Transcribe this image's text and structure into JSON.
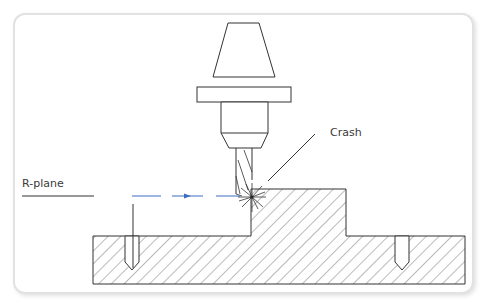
{
  "diagram": {
    "labels": {
      "r_plane": "R-plane",
      "crash": "Crash"
    },
    "colors": {
      "line": "#333333",
      "hatch": "#555555",
      "toolpath": "#3b6fc4",
      "frame_border": "#e2e2e2"
    },
    "elements": [
      "tool-holder-taper",
      "tool-holder-flange",
      "tool-holder-collet",
      "end-mill",
      "workpiece-base",
      "workpiece-raised-boss",
      "left-drilled-hole",
      "right-drilled-hole",
      "r-plane-line",
      "rapid-toolpath-arrow",
      "crash-burst",
      "crash-leader-line"
    ]
  }
}
